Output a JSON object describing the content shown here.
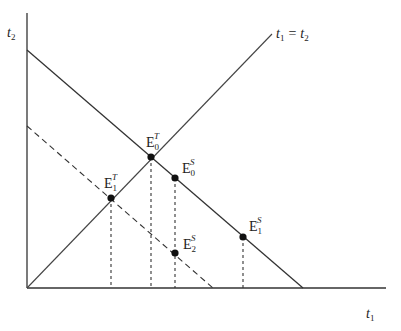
{
  "diagram": {
    "type": "economics-equilibrium-diagram",
    "axes": {
      "x_label": {
        "base": "t",
        "sub": "1"
      },
      "y_label": {
        "base": "t",
        "sub": "2"
      }
    },
    "lines": {
      "diagonal_label": {
        "left_base": "t",
        "left_sub": "1",
        "eq": "=",
        "right_base": "t",
        "right_sub": "2"
      },
      "solid_budget": "solid downward-sloping line",
      "dashed_budget": "dashed downward-sloping line"
    },
    "points": [
      {
        "id": "E0T",
        "base": "E",
        "sub": "0",
        "sup": "T"
      },
      {
        "id": "E1T",
        "base": "E",
        "sub": "1",
        "sup": "T"
      },
      {
        "id": "E0S",
        "base": "E",
        "sub": "0",
        "sup": "S"
      },
      {
        "id": "E1S",
        "base": "E",
        "sub": "1",
        "sup": "S"
      },
      {
        "id": "E2S",
        "base": "E",
        "sub": "2",
        "sup": "S"
      }
    ],
    "colors": {
      "line": "#333333",
      "point": "#111111",
      "background": "#ffffff"
    }
  }
}
